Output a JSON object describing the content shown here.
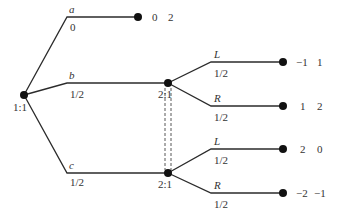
{
  "root": {
    "label": "1:1"
  },
  "chance_moves": [
    {
      "action": "a",
      "prob": "0"
    },
    {
      "action": "b",
      "prob": "1/2"
    },
    {
      "action": "c",
      "prob": "1/2"
    }
  ],
  "top_payoff": {
    "p1": "0",
    "p2": "2"
  },
  "player2_nodes": [
    {
      "label": "2:1",
      "moves": [
        {
          "action": "L",
          "prob": "1/2",
          "payoff": {
            "p1": "−1",
            "p2": "1"
          }
        },
        {
          "action": "R",
          "prob": "1/2",
          "payoff": {
            "p1": "1",
            "p2": "2"
          }
        }
      ]
    },
    {
      "label": "2:1",
      "moves": [
        {
          "action": "L",
          "prob": "1/2",
          "payoff": {
            "p1": "2",
            "p2": "0"
          }
        },
        {
          "action": "R",
          "prob": "1/2",
          "payoff": {
            "p1": "−2",
            "p2": "−1"
          }
        }
      ]
    }
  ]
}
